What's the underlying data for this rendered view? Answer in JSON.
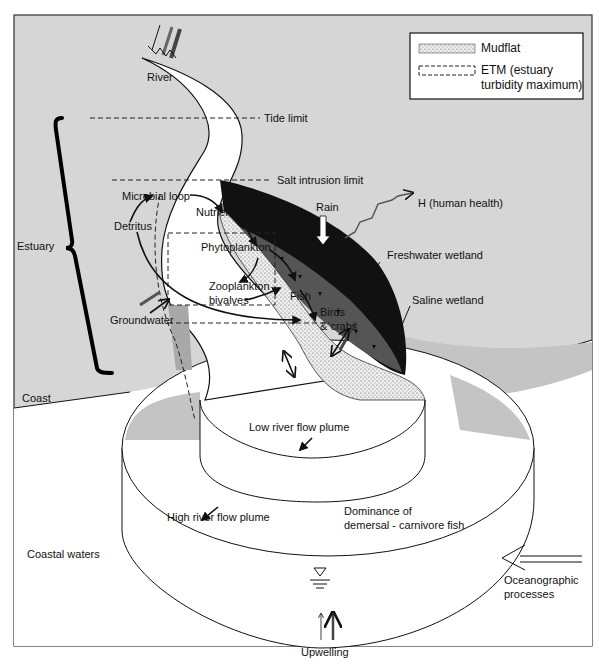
{
  "figure": {
    "colors": {
      "land": "#d4d4d4",
      "frame_border": "#333333",
      "water": "#ffffff",
      "coastal_shade": "#c8c8c8",
      "dark_wetland": "#111111",
      "saline_wetland": "#555555",
      "mudflat": "#e0e0e0",
      "etm_shade": "#a8a8a8"
    },
    "legend": {
      "items": [
        {
          "symbol": "stippled-rect",
          "label": "Mudflat"
        },
        {
          "symbol": "dashed-rect",
          "label_line1": "ETM (estuary",
          "label_line2": "turbidity maximum)"
        }
      ]
    },
    "labels": {
      "river": "River",
      "tide_limit": "Tide limit",
      "salt_intrusion_limit": "Salt intrusion limit",
      "estuary": "Estuary",
      "microbial_loop": "Microbial loop",
      "nutrient": "Nutrient",
      "detritus": "Detritus",
      "phytoplankton": "Phytoplankton",
      "fish": "Fish",
      "zooplankton_line1": "Zooplankton",
      "zooplankton_line2": "bivalves",
      "birds_line1": "Birds",
      "birds_line2": "& crabs",
      "groundwater": "Groundwater",
      "rain": "Rain",
      "human_health": "H (human health)",
      "freshwater_wetland": "Freshwater wetland",
      "saline_wetland": "Saline wetland",
      "coast": "Coast",
      "low_river_flow_plume": "Low river flow plume",
      "high_river_flow_plume": "High river flow plume",
      "dominance_line1": "Dominance of",
      "dominance_line2": "demersal - carnivore fish",
      "coastal_waters": "Coastal waters",
      "oceanographic_line1": "Oceanographic",
      "oceanographic_line2": "processes",
      "upwelling": "Upwelling"
    }
  }
}
